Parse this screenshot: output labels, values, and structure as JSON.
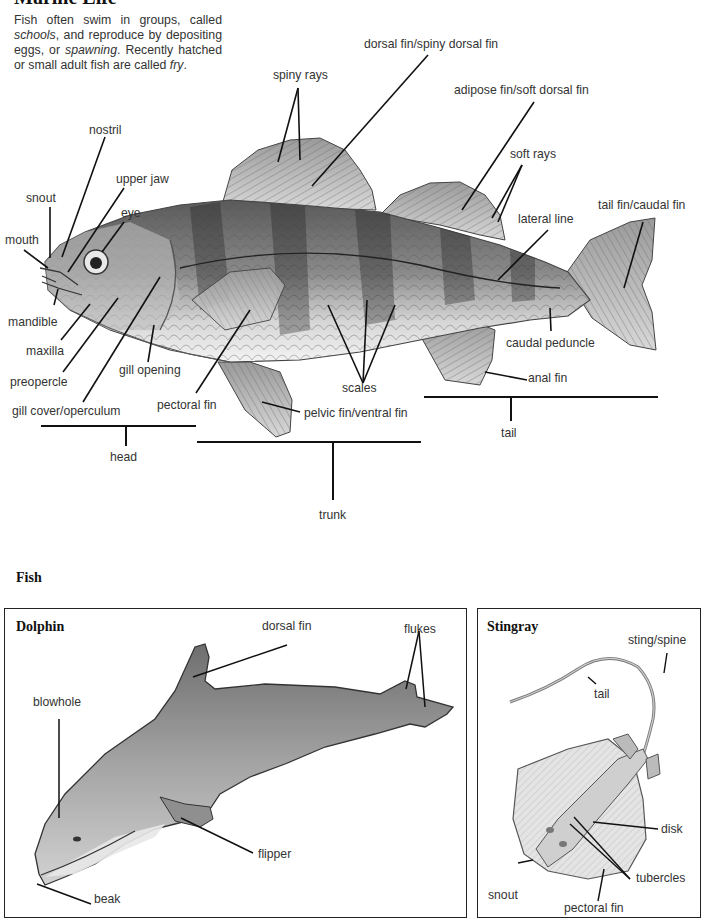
{
  "page": {
    "title": "Marine Life",
    "intro": {
      "p1": "Fish often swim in groups, called ",
      "schools": "schools",
      "p2": ", and reproduce by depositing eggs, or ",
      "spawning": "spawning",
      "p3": ". Recently hatched or small adult fish are called ",
      "fry": "fry",
      "p4": "."
    }
  },
  "fish_diagram": {
    "labels": {
      "nostril": "nostril",
      "upper_jaw": "upper jaw",
      "snout": "snout",
      "eye": "eye",
      "mouth": "mouth",
      "mandible": "mandible",
      "maxilla": "maxilla",
      "preopercle": "preopercle",
      "gill_cover": "gill cover/operculum",
      "gill_opening": "gill opening",
      "pectoral_fin": "pectoral fin",
      "pelvic_fin": "pelvic fin/ventral fin",
      "scales": "scales",
      "spiny_rays": "spiny rays",
      "dorsal_fin": "dorsal fin/spiny dorsal fin",
      "adipose_fin": "adipose fin/soft dorsal fin",
      "soft_rays": "soft rays",
      "lateral_line": "lateral line",
      "tail_fin": "tail fin/caudal fin",
      "caudal_peduncle": "caudal peduncle",
      "anal_fin": "anal fin"
    },
    "regions": {
      "head": "head",
      "trunk": "trunk",
      "tail": "tail"
    }
  },
  "section": {
    "title": "Fish"
  },
  "dolphin_panel": {
    "title": "Dolphin",
    "labels": {
      "dorsal_fin": "dorsal fin",
      "flukes": "flukes",
      "blowhole": "blowhole",
      "flipper": "flipper",
      "beak": "beak"
    }
  },
  "stingray_panel": {
    "title": "Stingray",
    "labels": {
      "sting_spine": "sting/spine",
      "tail": "tail",
      "disk": "disk",
      "tubercles": "tubercles",
      "snout": "snout",
      "pectoral_fin": "pectoral fin"
    }
  }
}
